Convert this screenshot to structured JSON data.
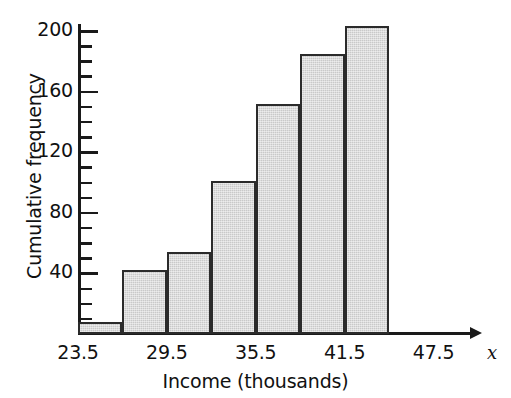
{
  "chart_data": {
    "type": "bar",
    "title": "",
    "subtitle": "",
    "xlabel": "Income (thousands)",
    "ylabel": "Cumulative frequency",
    "x_axis_variable": "x",
    "categories": [
      "23.5-26.5",
      "26.5-29.5",
      "29.5-32.5",
      "32.5-35.5",
      "35.5-38.5",
      "38.5-41.5",
      "41.5-44.5"
    ],
    "bin_edges": [
      23.5,
      26.5,
      29.5,
      32.5,
      35.5,
      38.5,
      41.5,
      44.5
    ],
    "values": [
      8,
      42,
      54,
      101,
      152,
      185,
      203
    ],
    "x_tick_labels": [
      "23.5",
      "29.5",
      "35.5",
      "41.5",
      "47.5"
    ],
    "x_tick_values": [
      23.5,
      29.5,
      35.5,
      41.5,
      47.5
    ],
    "xlim": [
      23.5,
      50.5
    ],
    "y_tick_labels": [
      "40",
      "80",
      "120",
      "160",
      "200"
    ],
    "y_tick_values": [
      40,
      80,
      120,
      160,
      200
    ],
    "y_minor_tick_step": 10,
    "ylim": [
      0,
      210
    ],
    "grid": false,
    "legend": null,
    "bar_fill_color": "#c9c9c9",
    "bar_edge_color": "#2b2b2b",
    "axis_color": "#1a1a1a",
    "background_color": "#ffffff"
  }
}
